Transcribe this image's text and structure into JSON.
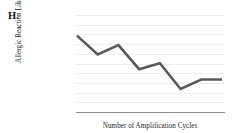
{
  "figure": {
    "panel_letter": "H."
  },
  "chart_data": {
    "type": "line",
    "title": "",
    "xlabel": "Number of Amplification Cycles",
    "ylabel": "Allergic Reaction Likelihood",
    "grid": true,
    "gridline_count": 11,
    "legend": null,
    "axis_ticks": {
      "x": [],
      "y": []
    },
    "xlim": [
      0,
      7
    ],
    "ylim": [
      0,
      10
    ],
    "x": [
      0,
      1,
      2,
      3,
      4,
      5,
      6,
      7
    ],
    "values": [
      8.3,
      6.1,
      7.2,
      4.4,
      5.1,
      2.1,
      3.2,
      3.2
    ],
    "series": [
      {
        "name": "Allergic Reaction Likelihood",
        "color": "#595959",
        "values": [
          8.3,
          6.1,
          7.2,
          4.4,
          5.1,
          2.1,
          3.2,
          3.2
        ]
      }
    ],
    "points_px": [
      [
        1,
        16
      ],
      [
        27,
        37
      ],
      [
        51,
        26
      ],
      [
        79,
        53
      ],
      [
        97,
        46
      ],
      [
        121,
        77
      ],
      [
        146,
        66
      ],
      [
        146,
        66
      ]
    ],
    "colors": {
      "line": "#595959",
      "gridline": "#ededed",
      "axis": "#8c8c8c",
      "background": "#ffffff",
      "text": "#262626"
    }
  }
}
